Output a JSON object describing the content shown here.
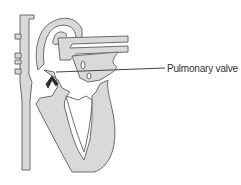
{
  "diagram": {
    "type": "heart cross-section",
    "labels": [
      {
        "id": "pulmonary-valve",
        "text": "Pulmonary valve"
      }
    ],
    "colors": {
      "tissue_fill": "#d9d9d9",
      "outline": "#6b6b6b",
      "highlight_valve": "#2a2a2a",
      "leader_line": "#444444",
      "background": "#ffffff"
    }
  }
}
